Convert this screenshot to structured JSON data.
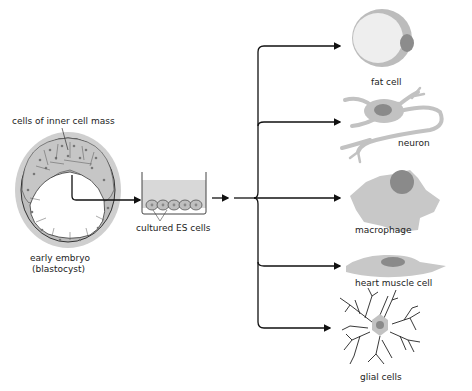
{
  "diagram": {
    "labels": {
      "inner_cell_mass": "cells of inner cell mass",
      "embryo_line1": "early embryo",
      "embryo_line2": "(blastocyst)",
      "cultured": "cultured ES cells",
      "fat_cell": "fat cell",
      "neuron": "neuron",
      "macrophage": "macrophage",
      "heart_muscle": "heart muscle cell",
      "glial": "glial cells"
    },
    "colors": {
      "cell_fill": "#d6d6d6",
      "cell_outline": "#3a3a3a",
      "nucleus": "#8a8a8a",
      "halo": "#c8c8c8",
      "fat_fill": "#ededed",
      "arrow": "#111111"
    }
  }
}
